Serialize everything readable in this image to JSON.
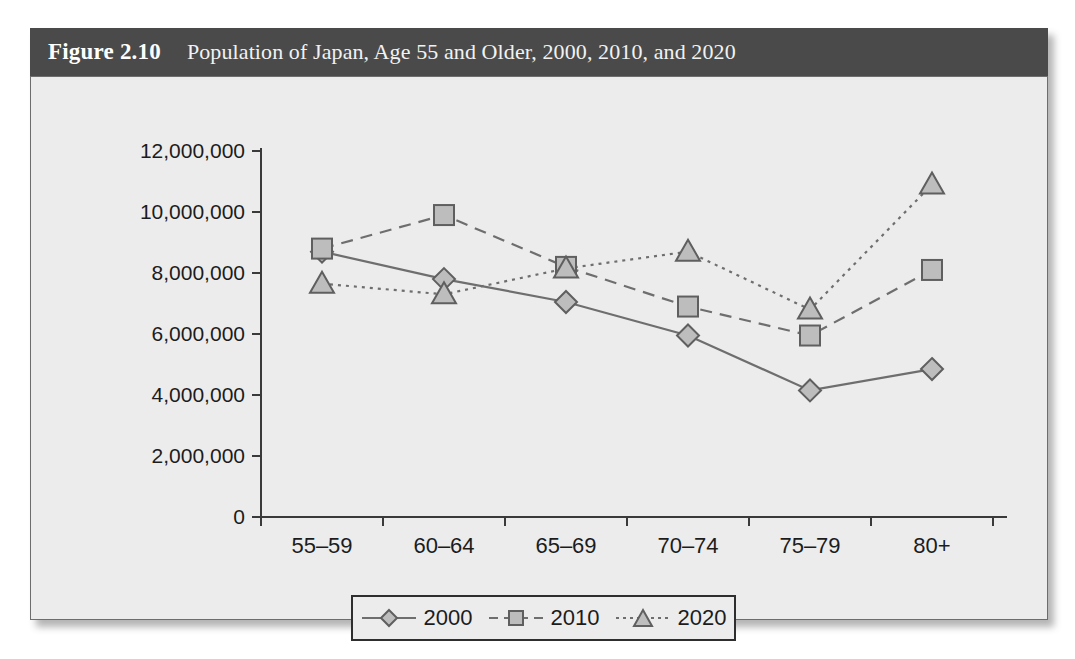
{
  "figure": {
    "number": "Figure 2.10",
    "caption": "Population of Japan, Age 55 and Older, 2000, 2010, and 2020"
  },
  "colors": {
    "header_bar": "#4a4a4a",
    "plot_background": "#ececec",
    "marker_fill": "#bdbdbd",
    "marker_stroke": "#5f5f5f",
    "line": "#6e6e6e",
    "axis": "#3a3a3a"
  },
  "chart_data": {
    "type": "line",
    "title": "Population of Japan, Age 55 and Older, 2000, 2010, and 2020",
    "xlabel": "",
    "ylabel": "",
    "categories": [
      "55–59",
      "60–64",
      "65–69",
      "70–74",
      "75–79",
      "80+"
    ],
    "ylim": [
      0,
      12000000
    ],
    "ytick_labels": [
      "12,000,000",
      "10,000,000",
      "8,000,000",
      "6,000,000",
      "4,000,000",
      "2,000,000",
      "0"
    ],
    "ytick_values": [
      12000000,
      10000000,
      8000000,
      6000000,
      4000000,
      2000000,
      0
    ],
    "grid": false,
    "legend_position": "bottom",
    "series": [
      {
        "name": "2000",
        "marker": "diamond",
        "line_style": "solid",
        "values": [
          8700000,
          7800000,
          7050000,
          5950000,
          4150000,
          4850000
        ]
      },
      {
        "name": "2010",
        "marker": "square",
        "line_style": "dashed",
        "values": [
          8800000,
          9900000,
          8200000,
          6900000,
          5950000,
          8100000
        ]
      },
      {
        "name": "2020",
        "marker": "triangle",
        "line_style": "dotted",
        "values": [
          7650000,
          7300000,
          8150000,
          8700000,
          6800000,
          10900000
        ]
      }
    ]
  },
  "legend": {
    "items": [
      {
        "label": "2000"
      },
      {
        "label": "2010"
      },
      {
        "label": "2020"
      }
    ]
  }
}
